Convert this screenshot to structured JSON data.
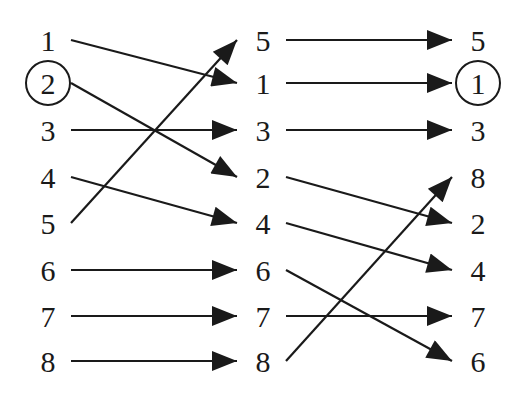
{
  "diagram": {
    "columns": [
      {
        "x": 48,
        "labels": [
          "1",
          "2",
          "3",
          "4",
          "5",
          "6",
          "7",
          "8"
        ],
        "circled_index": 1
      },
      {
        "x": 263,
        "labels": [
          "5",
          "1",
          "3",
          "2",
          "4",
          "6",
          "7",
          "8"
        ],
        "circled_index": null
      },
      {
        "x": 478,
        "labels": [
          "5",
          "1",
          "3",
          "8",
          "2",
          "4",
          "7",
          "6"
        ],
        "circled_index": 1
      }
    ],
    "row_y": [
      40,
      83,
      130,
      177,
      223,
      270,
      316,
      361
    ],
    "arrows_stage1": [
      {
        "from_row": 0,
        "to_row": 1,
        "value": "1"
      },
      {
        "from_row": 1,
        "to_row": 3,
        "value": "2"
      },
      {
        "from_row": 2,
        "to_row": 2,
        "value": "3"
      },
      {
        "from_row": 3,
        "to_row": 4,
        "value": "4"
      },
      {
        "from_row": 4,
        "to_row": 0,
        "value": "5"
      },
      {
        "from_row": 5,
        "to_row": 5,
        "value": "6"
      },
      {
        "from_row": 6,
        "to_row": 6,
        "value": "7"
      },
      {
        "from_row": 7,
        "to_row": 7,
        "value": "8"
      }
    ],
    "arrows_stage2": [
      {
        "from_row": 0,
        "to_row": 0,
        "value": "5"
      },
      {
        "from_row": 1,
        "to_row": 1,
        "value": "1"
      },
      {
        "from_row": 2,
        "to_row": 2,
        "value": "3"
      },
      {
        "from_row": 3,
        "to_row": 4,
        "value": "2"
      },
      {
        "from_row": 4,
        "to_row": 5,
        "value": "4"
      },
      {
        "from_row": 5,
        "to_row": 7,
        "value": "6"
      },
      {
        "from_row": 6,
        "to_row": 6,
        "value": "7"
      },
      {
        "from_row": 7,
        "to_row": 3,
        "value": "8"
      }
    ],
    "line_color": "#1a1a1a"
  }
}
